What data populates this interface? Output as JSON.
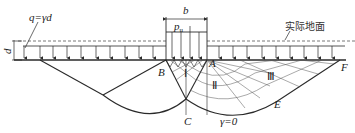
{
  "diagram": {
    "title": "",
    "labels": {
      "surcharge": "q=γd",
      "depth": "d",
      "width": "b",
      "pressure": "p",
      "pressure_sub": "u",
      "ground": "实际地面",
      "point_a": "A",
      "point_b": "B",
      "point_c": "C",
      "point_e": "E",
      "point_f": "F",
      "zone_1": "Ⅰ",
      "zone_2": "Ⅱ",
      "zone_3": "Ⅲ",
      "gamma": "γ=0"
    },
    "colors": {
      "line": "#2a2a2a",
      "dash": "#555555"
    }
  }
}
